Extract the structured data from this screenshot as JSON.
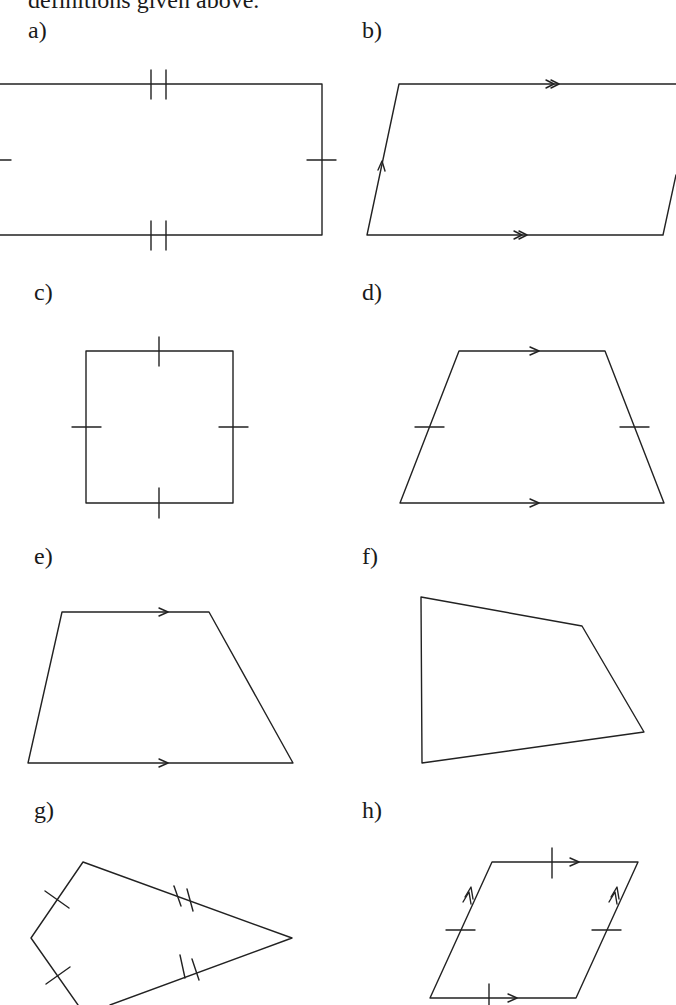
{
  "intro_text": "definitions given above.",
  "figures": [
    {
      "label": "a)",
      "shape": "rectangle",
      "markings": "equal-side ticks (single on short sides, double on long sides)"
    },
    {
      "label": "b)",
      "shape": "parallelogram",
      "markings": "parallel arrows (double on horizontal sides, single on slanted sides)"
    },
    {
      "label": "c)",
      "shape": "square",
      "markings": "single tick on all four sides"
    },
    {
      "label": "d)",
      "shape": "isosceles trapezium",
      "markings": "single arrows on parallel sides, single ticks on legs"
    },
    {
      "label": "e)",
      "shape": "trapezium",
      "markings": "single arrows on parallel sides"
    },
    {
      "label": "f)",
      "shape": "irregular quadrilateral",
      "markings": "none"
    },
    {
      "label": "g)",
      "shape": "kite",
      "markings": "single ticks on short sides, double ticks on long sides"
    },
    {
      "label": "h)",
      "shape": "rhombus",
      "markings": "single ticks on all sides, single arrows on horizontal sides, double arrows on slanted sides"
    }
  ]
}
